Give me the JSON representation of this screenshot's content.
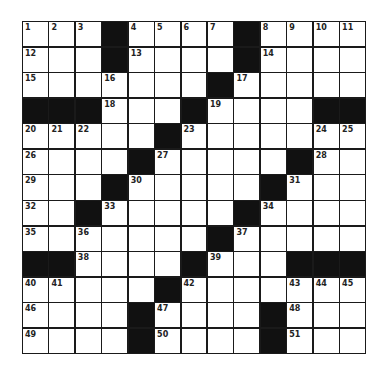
{
  "puzzle": {
    "rows": 13,
    "cols": 13,
    "colors": {
      "block": "#111111",
      "cell": "#ffffff",
      "line": "#1a1a1a"
    },
    "grid": [
      [
        "1",
        "2",
        "3",
        "#",
        "4",
        "5",
        "6",
        "7",
        "#",
        "8",
        "9",
        "10",
        "11"
      ],
      [
        "12",
        "",
        "",
        "#",
        "13",
        "",
        "",
        "",
        "#",
        "14",
        "",
        "",
        ""
      ],
      [
        "15",
        "",
        "",
        "16",
        "",
        "",
        "",
        "#",
        "17",
        "",
        "",
        "",
        ""
      ],
      [
        "#",
        "#",
        "#",
        "18",
        "",
        "",
        "#",
        "19",
        "",
        "",
        "",
        "#",
        "#"
      ],
      [
        "20",
        "21",
        "22",
        "",
        "",
        "#",
        "23",
        "",
        "",
        "",
        "",
        "24",
        "25"
      ],
      [
        "26",
        "",
        "",
        "",
        "#",
        "27",
        "",
        "",
        "",
        "",
        "#",
        "28",
        ""
      ],
      [
        "29",
        "",
        "",
        "#",
        "30",
        "",
        "",
        "",
        "",
        "#",
        "31",
        "",
        ""
      ],
      [
        "32",
        "",
        "#",
        "33",
        "",
        "",
        "",
        "",
        "#",
        "34",
        "",
        "",
        ""
      ],
      [
        "35",
        "",
        "36",
        "",
        "",
        "",
        "",
        "#",
        "37",
        "",
        "",
        "",
        ""
      ],
      [
        "#",
        "#",
        "38",
        "",
        "",
        "",
        "#",
        "39",
        "",
        "",
        "#",
        "#",
        "#"
      ],
      [
        "40",
        "41",
        "",
        "",
        "",
        "#",
        "42",
        "",
        "",
        "",
        "43",
        "44",
        "45"
      ],
      [
        "46",
        "",
        "",
        "",
        "#",
        "47",
        "",
        "",
        "",
        "#",
        "48",
        "",
        ""
      ],
      [
        "49",
        "",
        "",
        "",
        "#",
        "50",
        "",
        "",
        "",
        "#",
        "51",
        "",
        ""
      ]
    ]
  }
}
